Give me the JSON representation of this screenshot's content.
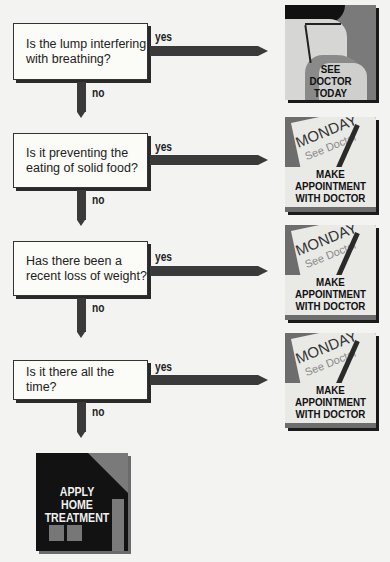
{
  "flowchart": {
    "questions": [
      {
        "text_line1": "Is the lump interfering",
        "text_line2": "with breathing?",
        "yes_label": "yes",
        "no_label": "no",
        "outcome": {
          "caption_lines": [
            "SEE",
            "DOCTOR",
            "TODAY"
          ],
          "icon": "doctor-profile-icon"
        }
      },
      {
        "text_line1": "Is it preventing the",
        "text_line2": "eating of solid food?",
        "yes_label": "yes",
        "no_label": "no",
        "outcome": {
          "note_day": "MONDAY",
          "note_text": "See Doctor",
          "caption_lines": [
            "MAKE",
            "APPOINTMENT",
            "WITH DOCTOR"
          ],
          "icon": "calendar-note-icon"
        }
      },
      {
        "text_line1": "Has there been a",
        "text_line2": "recent loss of weight?",
        "yes_label": "yes",
        "no_label": "no",
        "outcome": {
          "note_day": "MONDAY",
          "note_text": "See Doctor",
          "caption_lines": [
            "MAKE",
            "APPOINTMENT",
            "WITH DOCTOR"
          ],
          "icon": "calendar-note-icon"
        }
      },
      {
        "text_line1": "Is it there all the time?",
        "text_line2": "",
        "yes_label": "yes",
        "no_label": "no",
        "outcome": {
          "note_day": "MONDAY",
          "note_text": "See Doctor",
          "caption_lines": [
            "MAKE",
            "APPOINTMENT",
            "WITH DOCTOR"
          ],
          "icon": "calendar-note-icon"
        }
      }
    ],
    "final": {
      "caption_lines": [
        "APPLY",
        "HOME",
        "TREATMENT"
      ],
      "icon": "house-icon"
    }
  },
  "colors": {
    "background": "#f3f3f1",
    "arrow": "#3a3a3a",
    "box": "#fbfbf8",
    "icon_dark": "#121212",
    "icon_mid": "#6d6d6d"
  }
}
